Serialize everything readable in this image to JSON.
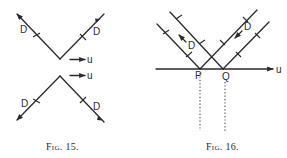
{
  "figures": [
    {
      "id": "fig15",
      "caption": "Fig. 15.",
      "labels": {
        "upper_left_D": "D",
        "upper_right_D": "D",
        "lower_left_D": "D",
        "lower_right_D": "D",
        "upper_velocity": "u",
        "lower_velocity": "u"
      }
    },
    {
      "id": "fig16",
      "caption": "Fig. 16.",
      "labels": {
        "left_D": "D",
        "right_D": "D",
        "point_P": "P",
        "point_Q": "Q",
        "axis_velocity": "u"
      }
    }
  ],
  "colors": {
    "ink": "#2a2a2a",
    "background": "#ffffff"
  }
}
